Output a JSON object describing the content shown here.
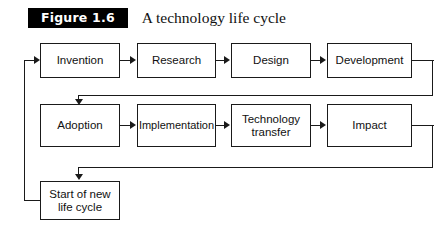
{
  "caption": {
    "figure_tag": "Figure 1.6",
    "title": "A technology life cycle"
  },
  "diagram": {
    "row1": [
      {
        "label": "Invention"
      },
      {
        "label": "Research"
      },
      {
        "label": "Design"
      },
      {
        "label": "Development"
      }
    ],
    "row2": [
      {
        "label": "Adoption"
      },
      {
        "label": "Implementation"
      },
      {
        "label": "Technology\ntransfer"
      },
      {
        "label": "Impact"
      }
    ],
    "row3": [
      {
        "label": "Start of new\nlife cycle"
      }
    ]
  },
  "colors": {
    "line": "#1a1a1a",
    "box_fill": "#ffffff",
    "tag_background": "#000000",
    "tag_text": "#ffffff",
    "page_background": "#ffffff"
  }
}
